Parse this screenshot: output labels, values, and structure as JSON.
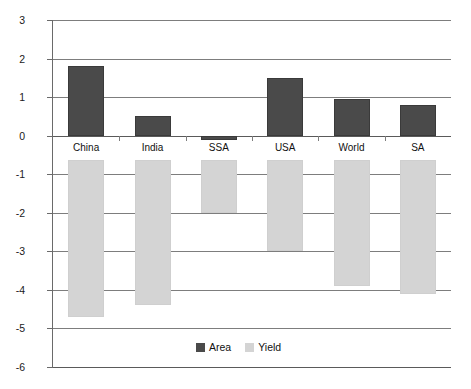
{
  "chart_data": {
    "type": "bar",
    "title": "",
    "xlabel": "",
    "ylabel": "% change from baseline trend",
    "categories": [
      "China",
      "India",
      "SSA",
      "USA",
      "World",
      "SA"
    ],
    "series": [
      {
        "name": "Area",
        "color": "#4a4a4a",
        "values": [
          1.8,
          0.5,
          -0.1,
          1.5,
          0.95,
          0.8
        ]
      },
      {
        "name": "Yield",
        "color": "#d4d4d4",
        "values": [
          -4.7,
          -4.4,
          -2.0,
          -3.0,
          -3.9,
          -4.1
        ]
      }
    ],
    "ylim": [
      -6,
      3
    ],
    "ytick_labels": [
      "3",
      "2",
      "1",
      "0",
      "-1",
      "-2",
      "-3",
      "-4",
      "-5",
      "-6"
    ],
    "ytick_values": [
      3,
      2,
      1,
      0,
      -1,
      -2,
      -3,
      -4,
      -5,
      -6
    ],
    "grid": true,
    "legend_position": "bottom-center",
    "legend_entries": [
      "Area",
      "Yield"
    ],
    "orientation": "vertical",
    "category_labels_inside_plot": true
  }
}
